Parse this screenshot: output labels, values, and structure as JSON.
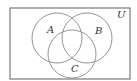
{
  "diagram": {
    "type": "venn",
    "universe": {
      "label": "U",
      "x": 10,
      "y": 8,
      "width": 120,
      "height": 71
    },
    "sets": [
      {
        "label": "A",
        "cx": 57,
        "cy": 38,
        "r": 25,
        "label_x": 47,
        "label_y": 33
      },
      {
        "label": "B",
        "cx": 87,
        "cy": 38,
        "r": 25,
        "label_x": 95,
        "label_y": 34
      },
      {
        "label": "C",
        "cx": 72,
        "cy": 54,
        "r": 24,
        "label_x": 71,
        "label_y": 72
      }
    ],
    "colors": {
      "stroke": "#8a8a8a",
      "border": "#7a7a7a",
      "text": "#333333",
      "background": "#ffffff"
    }
  }
}
